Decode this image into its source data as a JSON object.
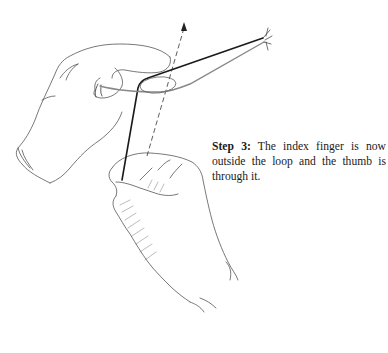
{
  "figure": {
    "elements": [
      "left-hand",
      "right-hand",
      "suture-strand",
      "suture-loop",
      "direction-arrow"
    ]
  },
  "caption": {
    "label": "Step 3:",
    "text": " The index finger is now outside the loop and the thumb is through it."
  },
  "colors": {
    "ink": "#1a1a1a",
    "outline": "#555555",
    "background": "#ffffff"
  }
}
